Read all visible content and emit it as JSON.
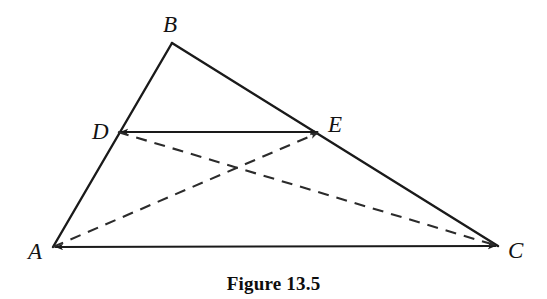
{
  "figure": {
    "caption": "Figure 13.5",
    "caption_position": {
      "x_center": 274,
      "y": 273
    },
    "background_color": "#ffffff",
    "stroke_color": "#1a1a1a",
    "dashed_stroke_color": "#2b2b2b",
    "canvas": {
      "width": 547,
      "height": 299
    },
    "points": [
      {
        "name": "A",
        "x": 53,
        "y": 247,
        "label": "A",
        "label_x": 28,
        "label_y": 240
      },
      {
        "name": "B",
        "x": 172,
        "y": 43,
        "label": "B",
        "label_x": 163,
        "label_y": 13
      },
      {
        "name": "C",
        "x": 498,
        "y": 246,
        "label": "C",
        "label_x": 508,
        "label_y": 239
      },
      {
        "name": "D",
        "x": 118,
        "y": 132,
        "label": "D",
        "label_x": 92,
        "label_y": 120
      },
      {
        "name": "E",
        "x": 320,
        "y": 132,
        "label": "E",
        "label_x": 328,
        "label_y": 113
      }
    ],
    "segments": [
      {
        "name": "side-AB",
        "from": "A",
        "to": "B",
        "style": "solid",
        "arrows": "none"
      },
      {
        "name": "side-BC",
        "from": "B",
        "to": "C",
        "style": "solid",
        "arrows": "none"
      },
      {
        "name": "side-AC",
        "from": "A",
        "to": "C",
        "style": "solid",
        "arrows": "both"
      },
      {
        "name": "midsegment-DE",
        "from": "D",
        "to": "E",
        "style": "solid",
        "arrows": "both"
      },
      {
        "name": "diagonal-DC",
        "from": "D",
        "to": "C",
        "style": "dashed",
        "arrows": "end"
      },
      {
        "name": "diagonal-AE",
        "from": "A",
        "to": "E",
        "style": "dashed",
        "arrows": "end"
      }
    ],
    "intersection": {
      "name": "diagonals-intersection",
      "x": 235,
      "y": 170
    }
  }
}
